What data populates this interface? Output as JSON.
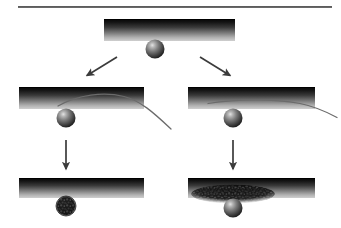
{
  "figure": {
    "domain_label": "Diagram",
    "title": "",
    "background_color": "#ffffff",
    "width": 341,
    "height": 228,
    "colors": {
      "bar_dark": "#1a1a1a",
      "bar_light": "#c8c8c8",
      "bar_edge": "#0d0d0d",
      "sphere_dark": "#2b2b2b",
      "sphere_mid": "#6e6e6e",
      "sphere_highlight": "#d8d8d8",
      "rough_dark": "#101010",
      "arrow": "#3b3b3b",
      "curve": "#555555",
      "rule": "#3a3a3a"
    }
  },
  "top_rule": {
    "name": "horizontal-rule",
    "x1": 18,
    "x2": 332,
    "y": 7,
    "thickness": 1.6
  },
  "panels": [
    {
      "id": "panel-top",
      "name": "panel-top-initial-contact",
      "label": "",
      "bar": {
        "x": 104,
        "y": 19,
        "width": 131,
        "height": 22,
        "gradient": "dark-to-light-vertical"
      },
      "sphere": {
        "cx": 155,
        "cy": 49,
        "r": 9.5,
        "style": "smooth"
      },
      "curve": null,
      "deposit": null
    },
    {
      "id": "panel-mid-left",
      "name": "panel-mid-left-deflection",
      "label": "",
      "bar": {
        "x": 19,
        "y": 87,
        "width": 125,
        "height": 22,
        "gradient": "dark-to-light-vertical"
      },
      "sphere": {
        "cx": 66,
        "cy": 118,
        "r": 9.5,
        "style": "smooth"
      },
      "curve": {
        "name": "deflection-curve-high-arc",
        "points": "60,105 80,97 100,94 120,96 138,104 152,116 170,128"
      },
      "deposit": null
    },
    {
      "id": "panel-mid-right",
      "name": "panel-mid-right-deflection",
      "label": "",
      "bar": {
        "x": 188,
        "y": 87,
        "width": 127,
        "height": 22,
        "gradient": "dark-to-light-vertical"
      },
      "sphere": {
        "cx": 233,
        "cy": 118,
        "r": 9.5,
        "style": "smooth"
      },
      "curve": {
        "name": "deflection-curve-low-arc",
        "points": "210,103 232,99 255,98 280,100 303,104 318,110 334,117"
      },
      "deposit": null
    },
    {
      "id": "panel-bottom-left",
      "name": "panel-bottom-left-outcome",
      "label": "",
      "bar": {
        "x": 19,
        "y": 178,
        "width": 125,
        "height": 20,
        "gradient": "dark-to-light-vertical"
      },
      "sphere": {
        "cx": 66,
        "cy": 206,
        "r": 10,
        "style": "rough"
      },
      "curve": null,
      "deposit": null
    },
    {
      "id": "panel-bottom-right",
      "name": "panel-bottom-right-outcome",
      "label": "",
      "bar": {
        "x": 188,
        "y": 178,
        "width": 127,
        "height": 20,
        "gradient": "dark-to-light-vertical"
      },
      "sphere": {
        "cx": 233,
        "cy": 208,
        "r": 9.5,
        "style": "smooth"
      },
      "curve": null,
      "deposit": {
        "name": "rough-debris-patch",
        "cx": 233,
        "cy": 194,
        "rx": 42,
        "ry": 9,
        "style": "rough"
      }
    }
  ],
  "arrows": [
    {
      "name": "arrow-branch-left",
      "label": "",
      "x1": 117,
      "y1": 57,
      "x2": 85,
      "y2": 77,
      "direction": "down-left"
    },
    {
      "name": "arrow-branch-right",
      "label": "",
      "x1": 200,
      "y1": 57,
      "x2": 232,
      "y2": 77,
      "direction": "down-right"
    },
    {
      "name": "arrow-step-left",
      "label": "",
      "x1": 66,
      "y1": 140,
      "x2": 66,
      "y2": 170,
      "direction": "down"
    },
    {
      "name": "arrow-step-right",
      "label": "",
      "x1": 233,
      "y1": 140,
      "x2": 233,
      "y2": 170,
      "direction": "down"
    }
  ],
  "rough_texture": {
    "name": "rough-speckle-pattern",
    "description": "dark irregular granular speckles"
  }
}
